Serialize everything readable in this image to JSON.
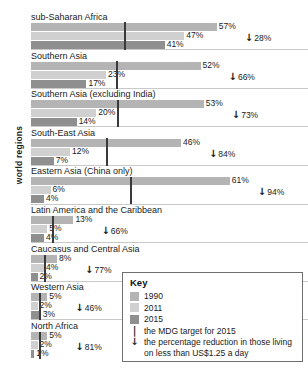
{
  "axis": {
    "y_title": "world regions"
  },
  "key": {
    "title": "Key",
    "items": [
      {
        "swatch": "1990-swatch",
        "label": "1990"
      },
      {
        "swatch": "2011-swatch",
        "label": "2011"
      },
      {
        "swatch": "2015-swatch",
        "label": "2015"
      }
    ],
    "notes": [
      {
        "glyph": "|",
        "icon": "mdg-target-tick-icon",
        "text": "the MDG target for 2015"
      },
      {
        "glyph": "↓",
        "icon": "down-arrow-icon",
        "text": "the percentage reduction in those living on less than US$1.25 a day"
      }
    ]
  },
  "colors": {
    "y1990": "#b4b4b4",
    "y2011": "#d0d0d0",
    "y2015": "#8f8f8f",
    "mdg_tick": "#3a3a3a",
    "text": "#1a1a1a",
    "key_border": "#6f6f6f"
  },
  "chart_data": {
    "type": "bar",
    "orientation": "horizontal",
    "title": "",
    "xlabel": "",
    "ylabel": "world regions",
    "grid": false,
    "legend_position": "bottom-right",
    "xlim": [
      0,
      61
    ],
    "unit": "%",
    "series_names": [
      "1990",
      "2011",
      "2015"
    ],
    "categories": [
      "sub-Saharan Africa",
      "Southern Asia",
      "Southern Asia (excluding India)",
      "South-East Asia",
      "Eastern Asia (China only)",
      "Latin America and the Caribbean",
      "Caucasus and Central Asia",
      "Western Asia",
      "North Africa"
    ],
    "series": [
      {
        "name": "1990",
        "values": [
          57,
          52,
          53,
          46,
          61,
          13,
          8,
          5,
          5
        ]
      },
      {
        "name": "2011",
        "values": [
          47,
          23,
          20,
          12,
          6,
          5,
          4,
          2,
          2
        ]
      },
      {
        "name": "2015",
        "values": [
          41,
          17,
          14,
          7,
          4,
          4,
          2,
          3,
          1
        ]
      }
    ],
    "mdg_target": [
      28.5,
      26,
      26.5,
      23,
      30.5,
      6.5,
      4,
      2.5,
      2.5
    ],
    "reduction": [
      {
        "label": "28%",
        "value": 28
      },
      {
        "label": "66%",
        "value": 66
      },
      {
        "label": "73%",
        "value": 73
      },
      {
        "label": "84%",
        "value": 84
      },
      {
        "label": "94%",
        "value": 94
      },
      {
        "label": "66%",
        "value": 66
      },
      {
        "label": "77%",
        "value": 77
      },
      {
        "label": "46%",
        "value": 46
      },
      {
        "label": "81%",
        "value": 81
      }
    ],
    "value_labels": [
      {
        "y1990": "57%",
        "y2011": "47%",
        "y2015": "41%"
      },
      {
        "y1990": "52%",
        "y2011": "23%",
        "y2015": "17%"
      },
      {
        "y1990": "53%",
        "y2011": "20%",
        "y2015": "14%"
      },
      {
        "y1990": "46%",
        "y2011": "12%",
        "y2015": "7%"
      },
      {
        "y1990": "61%",
        "y2011": "6%",
        "y2015": "4%"
      },
      {
        "y1990": "13%",
        "y2011": "5%",
        "y2015": "4%"
      },
      {
        "y1990": "8%",
        "y2011": "4%",
        "y2015": "2%"
      },
      {
        "y1990": "5%",
        "y2011": "2%",
        "y2015": "3%"
      },
      {
        "y1990": "5%",
        "y2011": "2%",
        "y2015": "1%"
      }
    ]
  }
}
